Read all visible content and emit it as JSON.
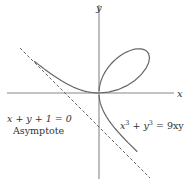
{
  "diagram": {
    "type": "curve-plot",
    "axes": {
      "x_label": "x",
      "y_label": "y"
    },
    "curve": {
      "equation_label": "x³ + y³ = 9xy",
      "equation_parts": {
        "lhs_a": "x",
        "exp_a": "3",
        "plus": "+",
        "lhs_b": "y",
        "exp_b": "3",
        "eq": "= 9xy"
      },
      "color": "#666666"
    },
    "asymptote": {
      "equation_label": "x + y  + 1 = 0",
      "caption": "Asymptote",
      "style": "dashed",
      "color": "#555555"
    },
    "colors": {
      "axes": "#888888",
      "curve": "#666666",
      "asymptote": "#555555",
      "text": "#333333",
      "background": "#ffffff"
    }
  }
}
